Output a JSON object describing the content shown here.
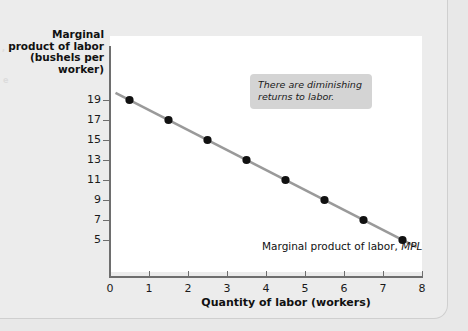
{
  "chart_data": {
    "type": "scatter",
    "title": "",
    "xlabel": "Quantity of labor (workers)",
    "ylabel": "Marginal product of labor (bushels per worker)",
    "ylabel_lines": [
      "Marginal",
      "product of labor",
      "(bushels per",
      "worker)"
    ],
    "xlim": [
      0,
      8
    ],
    "ylim": [
      0,
      20
    ],
    "grid": false,
    "x_ticks": [
      "0",
      "1",
      "2",
      "3",
      "4",
      "5",
      "6",
      "7",
      "8"
    ],
    "x_tick_values": [
      0,
      1,
      2,
      3,
      4,
      5,
      6,
      7,
      8
    ],
    "y_ticks": [
      "5",
      "7",
      "9",
      "11",
      "13",
      "15",
      "17",
      "19"
    ],
    "y_tick_values": [
      5,
      7,
      9,
      11,
      13,
      15,
      17,
      19
    ],
    "series": [
      {
        "name": "Marginal product of labor, MPL",
        "x": [
          0.5,
          1.5,
          2.5,
          3.5,
          4.5,
          5.5,
          6.5,
          7.5
        ],
        "values": [
          19,
          17,
          15,
          13,
          11,
          9,
          7,
          5
        ],
        "line_color": "#9a9a9a",
        "marker_color": "#111111"
      }
    ],
    "annotations": [
      {
        "name": "diminishing-returns-callout",
        "text": "There are diminishing returns to labor.",
        "x": 0,
        "y": 0
      }
    ]
  },
  "series_label": {
    "text": "Marginal product of labor,",
    "symbol": "MPL"
  },
  "annotation": {
    "text": "There are diminishing returns to labor."
  },
  "bleed": {
    "mark_a": ",",
    "mark_b": "e"
  },
  "colors": {
    "page_background": "#ececec",
    "plot_background": "#ffffff",
    "axis": "#6e6e6e",
    "line": "#9a9a9a",
    "marker": "#111111",
    "annotation_background": "#d4d4d4",
    "text": "#111111"
  }
}
